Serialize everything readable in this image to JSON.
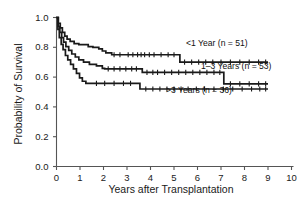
{
  "chart_data": {
    "type": "line",
    "title": "",
    "subtitle": "",
    "xlabel": "Years after Transplantation",
    "ylabel": "Probability of Survival",
    "xlim": [
      0,
      10
    ],
    "ylim": [
      0.0,
      1.0
    ],
    "xticks": [
      "0",
      "1",
      "2",
      "3",
      "4",
      "5",
      "6",
      "7",
      "8",
      "9",
      "10"
    ],
    "yticks": [
      "0.0",
      "0.2",
      "0.4",
      "0.6",
      "0.8",
      "1.0"
    ],
    "grid": false,
    "legend_position": "inline-right",
    "style": "kaplan-meier step curves with censoring tick marks",
    "annotations": [
      "<1 Year (n = 51)",
      "1–3 Years (n = 53)",
      ">3 Years (n = 36)"
    ],
    "series": [
      {
        "name": "<1 Year (n = 51)",
        "n": 51,
        "label": "<1 Year (n = 51)",
        "color": "#1a1a1a",
        "steps": [
          [
            0.0,
            1.0
          ],
          [
            0.08,
            0.96
          ],
          [
            0.16,
            0.93
          ],
          [
            0.25,
            0.9
          ],
          [
            0.35,
            0.875
          ],
          [
            0.45,
            0.855
          ],
          [
            0.58,
            0.84
          ],
          [
            0.75,
            0.825
          ],
          [
            0.95,
            0.818
          ],
          [
            1.25,
            0.818
          ],
          [
            1.35,
            0.805
          ],
          [
            1.55,
            0.8
          ],
          [
            1.8,
            0.79
          ],
          [
            1.95,
            0.775
          ],
          [
            2.1,
            0.762
          ],
          [
            2.35,
            0.75
          ],
          [
            5.2,
            0.75
          ],
          [
            5.25,
            0.7
          ],
          [
            9.0,
            0.7
          ]
        ],
        "censored": [
          2.45,
          2.7,
          3.05,
          3.25,
          3.45,
          3.6,
          3.75,
          3.95,
          4.15,
          4.45,
          4.75,
          5.0,
          5.45,
          5.75,
          6.05,
          6.35,
          6.65,
          7.0,
          7.4,
          7.8,
          8.2,
          8.6,
          8.9
        ],
        "final_value": 0.7
      },
      {
        "name": "1–3 Years (n = 53)",
        "n": 53,
        "label": "1–3 Years (n = 53)",
        "color": "#1a1a1a",
        "steps": [
          [
            0.0,
            1.0
          ],
          [
            0.07,
            0.94
          ],
          [
            0.14,
            0.9
          ],
          [
            0.22,
            0.865
          ],
          [
            0.3,
            0.835
          ],
          [
            0.4,
            0.805
          ],
          [
            0.52,
            0.78
          ],
          [
            0.65,
            0.755
          ],
          [
            0.8,
            0.735
          ],
          [
            0.95,
            0.715
          ],
          [
            1.15,
            0.7
          ],
          [
            1.4,
            0.685
          ],
          [
            1.7,
            0.675
          ],
          [
            1.95,
            0.658
          ],
          [
            2.05,
            0.655
          ],
          [
            3.55,
            0.655
          ],
          [
            3.65,
            0.632
          ],
          [
            7.05,
            0.632
          ],
          [
            7.12,
            0.555
          ],
          [
            9.0,
            0.555
          ]
        ],
        "censored": [
          2.2,
          2.45,
          2.7,
          2.95,
          3.2,
          3.4,
          3.85,
          4.1,
          4.3,
          4.6,
          4.9,
          5.2,
          5.5,
          5.8,
          6.1,
          6.4,
          6.7,
          6.95,
          7.4,
          7.8,
          8.2,
          8.6,
          8.9
        ],
        "final_value": 0.555
      },
      {
        "name": ">3 Years (n = 36)",
        "n": 36,
        "label": ">3 Years (n = 36)",
        "color": "#1a1a1a",
        "steps": [
          [
            0.0,
            1.0
          ],
          [
            0.06,
            0.92
          ],
          [
            0.12,
            0.865
          ],
          [
            0.2,
            0.82
          ],
          [
            0.28,
            0.785
          ],
          [
            0.38,
            0.745
          ],
          [
            0.48,
            0.715
          ],
          [
            0.6,
            0.685
          ],
          [
            0.72,
            0.655
          ],
          [
            0.85,
            0.625
          ],
          [
            0.98,
            0.595
          ],
          [
            1.1,
            0.572
          ],
          [
            1.25,
            0.558
          ],
          [
            3.45,
            0.558
          ],
          [
            3.55,
            0.52
          ],
          [
            9.0,
            0.52
          ]
        ],
        "censored": [
          1.7,
          2.05,
          2.45,
          2.85,
          3.15,
          3.8,
          4.1,
          4.4,
          4.7,
          5.0,
          5.3,
          5.6,
          5.95,
          6.3,
          6.7,
          7.1,
          7.5,
          7.9,
          8.3,
          8.65,
          8.9
        ],
        "final_value": 0.52
      }
    ]
  }
}
